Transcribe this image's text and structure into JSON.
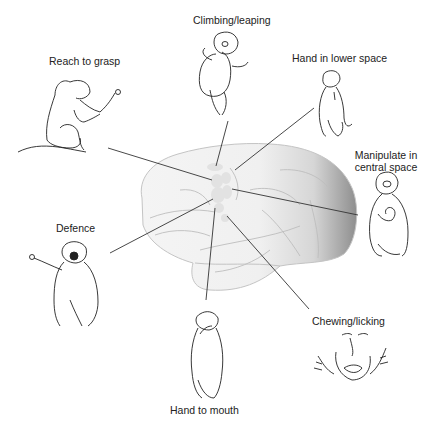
{
  "diagram": {
    "type": "brain-region-map",
    "colors": {
      "brain_fill_light": "#f2f2f2",
      "brain_fill_dark": "#9a9a9a",
      "brain_outline": "#c4c4c4",
      "sulci": "#bdbdbd",
      "motor_zone": "#e3e3e3",
      "leader_line": "#333333",
      "drawing_stroke": "#222222",
      "text": "#222222"
    },
    "behaviors": [
      {
        "id": "reach",
        "label": "Reach to grasp"
      },
      {
        "id": "climb",
        "label": "Climbing/leaping"
      },
      {
        "id": "lower",
        "label": "Hand in lower space"
      },
      {
        "id": "central",
        "label_line1": "Manipulate in",
        "label_line2": "central space"
      },
      {
        "id": "defence",
        "label": "Defence"
      },
      {
        "id": "mouth",
        "label": "Hand to mouth"
      },
      {
        "id": "chew",
        "label": "Chewing/licking"
      }
    ]
  }
}
